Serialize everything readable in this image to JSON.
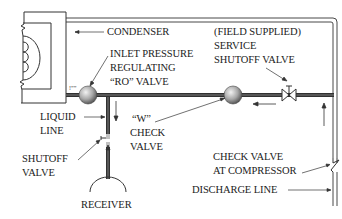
{
  "diagram": {
    "colors": {
      "line": "#333333",
      "pipe_dark": "#3a3a3a",
      "pipe_light": "#9a9a9a",
      "valve_ball_light": "#e8e8e8",
      "valve_ball_dark": "#5a5a5a",
      "text": "#222222",
      "background": "#ffffff"
    },
    "labels": {
      "condenser": "CONDENSER",
      "inlet_pressure": {
        "line1": "INLET PRESSURE",
        "line2": "REGULATING",
        "line3": "“RO” VALVE"
      },
      "field_supplied": {
        "line1": "(FIELD SUPPLIED)",
        "line2": "SERVICE",
        "line3": "SHUTOFF VALVE"
      },
      "liquid_line": {
        "line1": "LIQUID",
        "line2": "LINE"
      },
      "w_check_valve": {
        "line1": "“W”",
        "line2": "CHECK",
        "line3": "VALVE"
      },
      "shutoff_valve": {
        "line1": "SHUTOFF",
        "line2": "VALVE"
      },
      "receiver": "RECEIVER",
      "check_valve_compressor": {
        "line1": "CHECK VALVE",
        "line2": "AT COMPRESSOR"
      },
      "discharge_line": "DISCHARGE LINE",
      "port_mark": "!””"
    },
    "components": [
      {
        "id": "condenser",
        "type": "condenser"
      },
      {
        "id": "ro-valve",
        "type": "ball-valve"
      },
      {
        "id": "w-check-valve",
        "type": "ball-valve"
      },
      {
        "id": "service-shutoff-valve",
        "type": "gate-valve"
      },
      {
        "id": "shutoff-valve",
        "type": "shutoff"
      },
      {
        "id": "receiver",
        "type": "receiver"
      },
      {
        "id": "compressor-check-valve",
        "type": "check-valve"
      }
    ]
  }
}
